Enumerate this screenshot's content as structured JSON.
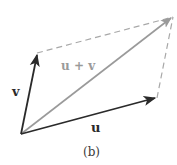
{
  "diagram": {
    "type": "vector-parallelogram",
    "caption": "(b)",
    "labels": {
      "u": "u",
      "v": "v",
      "sum": "u + v"
    },
    "points": {
      "origin": [
        21,
        134
      ],
      "u_tip": [
        157,
        98
      ],
      "v_tip": [
        37,
        53
      ],
      "sum_tip": [
        173,
        17
      ]
    },
    "colors": {
      "vector": "#2a2a2a",
      "sum_vector": "#9a9a9a",
      "dashed": "#a8a8a8",
      "sum_label": "#9a9a9a",
      "label": "#2a2a2a"
    }
  }
}
